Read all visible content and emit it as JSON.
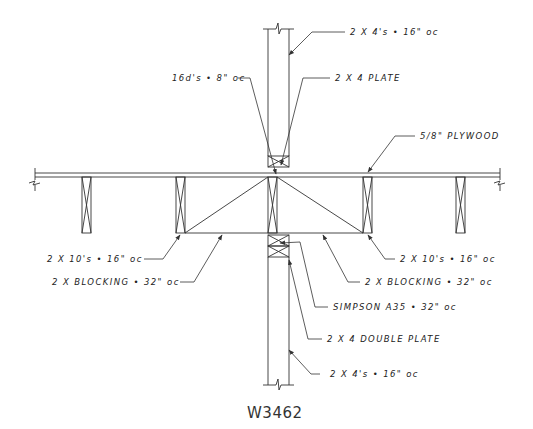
{
  "drawing": {
    "id": "W3462",
    "line_color": "#333333",
    "background": "#ffffff"
  },
  "labels": {
    "studs_top": "2 X 4's • 16\" oc",
    "nails": "16d's • 8\" oc",
    "plate": "2 X 4 PLATE",
    "plywood": "5/8\" PLYWOOD",
    "joists_left": "2 X 10's • 16\" oc",
    "joists_right": "2 X 10's • 16\" oc",
    "blocking_left": "2 X BLOCKING • 32\" oc",
    "blocking_right": "2 X BLOCKING • 32\" oc",
    "simpson": "SIMPSON A35 • 32\" oc",
    "double_plate": "2 X 4 DOUBLE PLATE",
    "studs_bottom": "2 X 4's • 16\" oc"
  }
}
